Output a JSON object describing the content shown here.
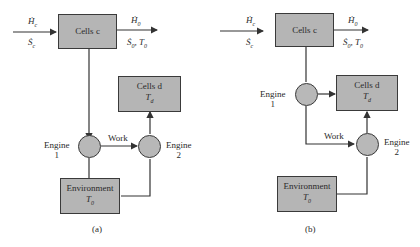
{
  "diagram_a": {
    "caption": "(a)",
    "cells_c": {
      "label": "Cells c"
    },
    "cells_d": {
      "label": "Cells d",
      "temp": "T_d"
    },
    "environment": {
      "label": "Environment",
      "temp": "T_0"
    },
    "engine1": {
      "label": "Engine",
      "num": "1"
    },
    "engine2": {
      "label": "Engine",
      "num": "2"
    },
    "work_label": "Work",
    "input_top": "Ḣ_c",
    "input_bottom": "Ṡ_c",
    "output_top": "Ḣ_0",
    "output_bottom": "Ṡ_0, T_0"
  },
  "diagram_b": {
    "caption": "(b)",
    "cells_c": {
      "label": "Cells c"
    },
    "cells_d": {
      "label": "Cells d",
      "temp": "T_d"
    },
    "environment": {
      "label": "Environment",
      "temp": "T_0"
    },
    "engine1": {
      "label": "Engine",
      "num": "1"
    },
    "engine2": {
      "label": "Engine",
      "num": "2"
    },
    "work_label": "Work",
    "input_top": "Ḣ_c",
    "input_bottom": "Ṡ_c",
    "output_top": "Ḣ_0",
    "output_bottom": "Ṡ_0, T_0"
  }
}
